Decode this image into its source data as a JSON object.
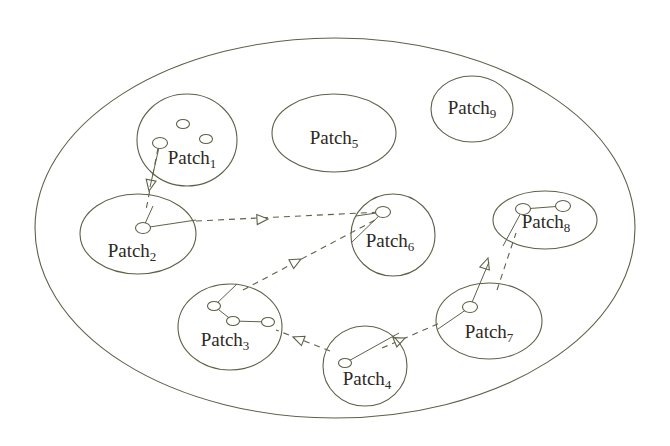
{
  "diagram": {
    "stroke_color": "#5f6048",
    "text_color": "#2e2a22",
    "background": "#ffffff",
    "node_fill": "#ffffff",
    "universe": {
      "name": "outer-boundary-ellipse",
      "cx": 335,
      "cy": 228,
      "rx": 300,
      "ry": 190
    },
    "patches": [
      {
        "id": "patch1",
        "label_text": "Patch",
        "label_sub": "1",
        "cx": 187,
        "cy": 140,
        "rx": 50,
        "ry": 46,
        "label_x": 192,
        "label_y": 160,
        "nodes": [
          {
            "cx": 183,
            "cy": 124,
            "r": 5
          },
          {
            "cx": 206,
            "cy": 139,
            "r": 5
          },
          {
            "cx": 160,
            "cy": 143,
            "r": 6
          }
        ],
        "edges": []
      },
      {
        "id": "patch2",
        "label_text": "Patch",
        "label_sub": "2",
        "cx": 138,
        "cy": 234,
        "rx": 58,
        "ry": 40,
        "label_x": 132,
        "label_y": 253,
        "nodes": [
          {
            "cx": 143,
            "cy": 228,
            "r": 6
          }
        ],
        "edges": []
      },
      {
        "id": "patch3",
        "label_text": "Patch",
        "label_sub": "3",
        "cx": 230,
        "cy": 327,
        "rx": 52,
        "ry": 43,
        "label_x": 225,
        "label_y": 342,
        "nodes": [
          {
            "cx": 214,
            "cy": 306,
            "r": 5
          },
          {
            "cx": 233,
            "cy": 321,
            "r": 5
          },
          {
            "cx": 268,
            "cy": 322,
            "r": 5
          }
        ],
        "edges": [
          {
            "x1": 214,
            "y1": 306,
            "x2": 233,
            "y2": 321
          },
          {
            "x1": 233,
            "y1": 321,
            "x2": 268,
            "y2": 322
          }
        ]
      },
      {
        "id": "patch4",
        "label_text": "Patch",
        "label_sub": "4",
        "cx": 365,
        "cy": 366,
        "rx": 42,
        "ry": 40,
        "label_x": 367,
        "label_y": 381,
        "nodes": [
          {
            "cx": 345,
            "cy": 363,
            "r": 5
          }
        ],
        "edges": []
      },
      {
        "id": "patch5",
        "label_text": "Patch",
        "label_sub": "5",
        "cx": 334,
        "cy": 133,
        "rx": 62,
        "ry": 39,
        "label_x": 334,
        "label_y": 140,
        "nodes": [],
        "edges": []
      },
      {
        "id": "patch6",
        "label_text": "Patch",
        "label_sub": "6",
        "cx": 393,
        "cy": 235,
        "rx": 42,
        "ry": 41,
        "label_x": 390,
        "label_y": 243,
        "nodes": [
          {
            "cx": 383,
            "cy": 212,
            "r": 6
          }
        ],
        "edges": []
      },
      {
        "id": "patch7",
        "label_text": "Patch",
        "label_sub": "7",
        "cx": 489,
        "cy": 321,
        "rx": 53,
        "ry": 38,
        "label_x": 489,
        "label_y": 334,
        "nodes": [
          {
            "cx": 470,
            "cy": 307,
            "r": 6
          }
        ],
        "edges": []
      },
      {
        "id": "patch8",
        "label_text": "Patch",
        "label_sub": "8",
        "cx": 545,
        "cy": 220,
        "rx": 52,
        "ry": 29,
        "label_x": 546,
        "label_y": 224,
        "nodes": [
          {
            "cx": 523,
            "cy": 209,
            "r": 6
          },
          {
            "cx": 563,
            "cy": 206,
            "r": 6
          }
        ],
        "edges": [
          {
            "x1": 523,
            "y1": 209,
            "x2": 563,
            "y2": 206
          }
        ]
      },
      {
        "id": "patch9",
        "label_text": "Patch",
        "label_sub": "9",
        "cx": 472,
        "cy": 109,
        "rx": 41,
        "ry": 33,
        "label_x": 472,
        "label_y": 110,
        "nodes": [],
        "edges": []
      }
    ],
    "intra_links": [
      {
        "name": "link-patch2-node-to-right",
        "x1": 143,
        "y1": 228,
        "x2": 196,
        "y2": 220
      },
      {
        "name": "link-patch2-node-to-up",
        "x1": 143,
        "y1": 228,
        "x2": 153,
        "y2": 206
      },
      {
        "name": "link-patch6-node-to-left",
        "x1": 383,
        "y1": 212,
        "x2": 356,
        "y2": 216
      },
      {
        "name": "link-patch6-node-to-lower-left",
        "x1": 383,
        "y1": 212,
        "x2": 351,
        "y2": 243
      },
      {
        "name": "link-patch3-node-to-upper-right",
        "x1": 214,
        "y1": 306,
        "x2": 237,
        "y2": 284
      },
      {
        "name": "link-patch4-node-to-upper-right",
        "x1": 345,
        "y1": 363,
        "x2": 399,
        "y2": 333
      },
      {
        "name": "link-patch7-node-to-lower-left",
        "x1": 470,
        "y1": 307,
        "x2": 438,
        "y2": 329
      },
      {
        "name": "link-patch7-node-to-upper",
        "x1": 470,
        "y1": 307,
        "x2": 489,
        "y2": 262
      },
      {
        "name": "link-patch8-node-to-lower-left",
        "x1": 523,
        "y1": 209,
        "x2": 503,
        "y2": 246
      },
      {
        "name": "link-patch1-node-to-lower",
        "x1": 160,
        "y1": 143,
        "x2": 150,
        "y2": 187
      }
    ],
    "arrows": [
      {
        "name": "arrow-patch1-to-patch2",
        "x1": 158,
        "y1": 148,
        "x2": 146,
        "y2": 210,
        "head_x": 149,
        "head_y": 191,
        "angle": 101
      },
      {
        "name": "arrow-patch2-to-patch6",
        "x1": 196,
        "y1": 221,
        "x2": 382,
        "y2": 212,
        "head_x": 268,
        "head_y": 219,
        "angle": -3
      },
      {
        "name": "arrow-patch3-to-patch6",
        "x1": 243,
        "y1": 290,
        "x2": 379,
        "y2": 218,
        "head_x": 301,
        "head_y": 259,
        "angle": -28
      },
      {
        "name": "arrow-patch4-to-patch3",
        "x1": 330,
        "y1": 351,
        "x2": 276,
        "y2": 330,
        "head_x": 293,
        "head_y": 337,
        "angle": 201
      },
      {
        "name": "arrow-patch4-to-patch7",
        "x1": 382,
        "y1": 348,
        "x2": 440,
        "y2": 323,
        "head_x": 405,
        "head_y": 338,
        "angle": -23
      },
      {
        "name": "arrow-patch7-to-patch8",
        "x1": 497,
        "y1": 290,
        "x2": 516,
        "y2": 233,
        "head_x": 488,
        "head_y": 258,
        "angle": -72
      }
    ]
  }
}
